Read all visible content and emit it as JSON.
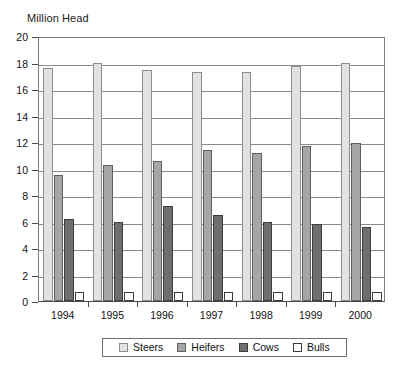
{
  "chart_data": {
    "type": "bar",
    "title": "Million Head",
    "xlabel": "",
    "ylabel": "Million Head",
    "categories": [
      "1994",
      "1995",
      "1996",
      "1997",
      "1998",
      "1999",
      "2000"
    ],
    "series": [
      {
        "name": "Steers",
        "color": "#e2e2e2",
        "values": [
          17.6,
          18.0,
          17.4,
          17.3,
          17.3,
          17.7,
          18.0
        ]
      },
      {
        "name": "Heifers",
        "color": "#a6a6a6",
        "values": [
          9.5,
          10.3,
          10.6,
          11.4,
          11.2,
          11.7,
          11.9
        ]
      },
      {
        "name": "Cows",
        "color": "#6e6e6e",
        "values": [
          6.2,
          6.0,
          7.2,
          6.5,
          6.0,
          5.8,
          5.6
        ]
      },
      {
        "name": "Bulls",
        "color": "#ffffff",
        "values": [
          0.7,
          0.7,
          0.7,
          0.7,
          0.7,
          0.7,
          0.7
        ]
      }
    ],
    "ylim": [
      0,
      20
    ],
    "yticks": [
      0,
      2,
      4,
      6,
      8,
      10,
      12,
      14,
      16,
      18,
      20
    ],
    "ytick_labels": [
      "0",
      "2",
      "4",
      "6",
      "8",
      "10",
      "12",
      "14",
      "16",
      "18",
      "20"
    ],
    "grid": true,
    "grid_axis": "y",
    "legend_position": "bottom",
    "legend_entries": [
      "Steers",
      "Heifers",
      "Cows",
      "Bulls"
    ]
  }
}
